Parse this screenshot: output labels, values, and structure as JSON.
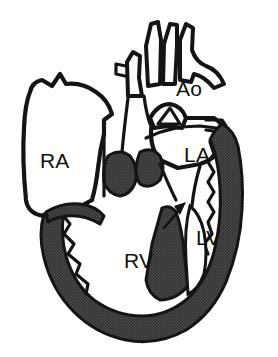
{
  "figure": {
    "background_color": "#ffffff",
    "ink_color": "#141414",
    "myocardium_color": "#3a3a3a"
  },
  "labels": {
    "right_atrium": "RA",
    "left_atrium": "LA",
    "right_ventricle": "RV",
    "left_ventricle": "LV",
    "aorta": "Ao"
  },
  "annotations": {
    "pointer": {
      "name": "arrow",
      "direction": "up-right",
      "points_at": "interventricular septum"
    }
  },
  "structures": [
    {
      "id": "right-atrium",
      "label": "RA",
      "shaded": false
    },
    {
      "id": "left-atrium",
      "label": "LA",
      "shaded": false
    },
    {
      "id": "right-ventricle",
      "label": "RV",
      "shaded": false
    },
    {
      "id": "left-ventricle",
      "label": "LV",
      "shaded": false
    },
    {
      "id": "aorta",
      "label": "Ao",
      "shaded": false
    },
    {
      "id": "myocardial-wall",
      "label": "",
      "shaded": true
    },
    {
      "id": "interventricular-septum",
      "label": "",
      "shaded": true
    },
    {
      "id": "atrioventricular-valves",
      "label": "",
      "shaded": true
    }
  ]
}
